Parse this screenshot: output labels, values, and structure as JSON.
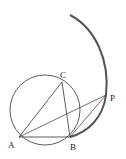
{
  "diagram": {
    "points": {
      "A": {
        "label": "A",
        "x": 19,
        "y": 137
      },
      "B": {
        "label": "B",
        "x": 70,
        "y": 137
      },
      "C": {
        "label": "C",
        "x": 62,
        "y": 82
      },
      "P": {
        "label": "P",
        "x": 106,
        "y": 95
      }
    },
    "circle": {
      "cx": 45,
      "cy": 110,
      "r": 35
    },
    "segments": [
      "AB",
      "AC",
      "BC",
      "AP",
      "BP"
    ],
    "arc": {
      "description": "thick arc from top through P to B"
    },
    "colors": {
      "stroke": "#333333",
      "arc": "#555555",
      "background": "#ffffff"
    }
  }
}
